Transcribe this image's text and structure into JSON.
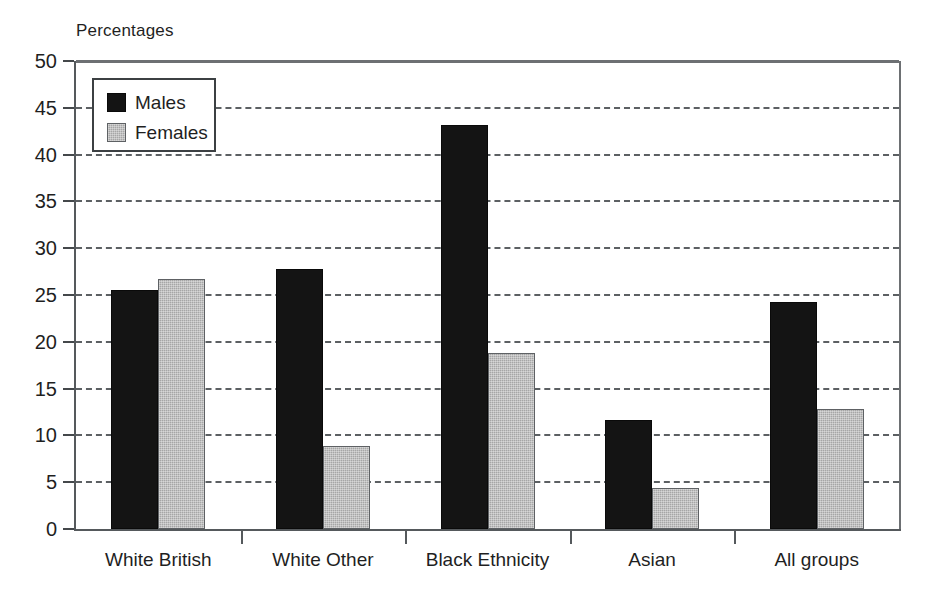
{
  "chart_data": {
    "type": "bar",
    "title": "",
    "ylabel": "Percentages",
    "xlabel": "",
    "ylim": [
      0,
      50
    ],
    "ytick_step": 5,
    "yticks": [
      0,
      5,
      10,
      15,
      20,
      25,
      30,
      35,
      40,
      45,
      50
    ],
    "grid": true,
    "grid_style": "dashed-horizontal",
    "legend_position": "top-left-inside",
    "categories": [
      "White British",
      "White Other",
      "Black Ethnicity",
      "Asian",
      "All groups"
    ],
    "series": [
      {
        "name": "Males",
        "color": "#141414",
        "values": [
          25.5,
          27.8,
          43.2,
          11.7,
          24.3
        ]
      },
      {
        "name": "Females",
        "color": "#a6a6a6",
        "values": [
          26.7,
          8.9,
          18.8,
          4.4,
          12.8
        ]
      }
    ]
  },
  "axis": {
    "y_title": "Percentages"
  },
  "legend": {
    "entries": [
      {
        "label": "Males"
      },
      {
        "label": "Females"
      }
    ]
  }
}
